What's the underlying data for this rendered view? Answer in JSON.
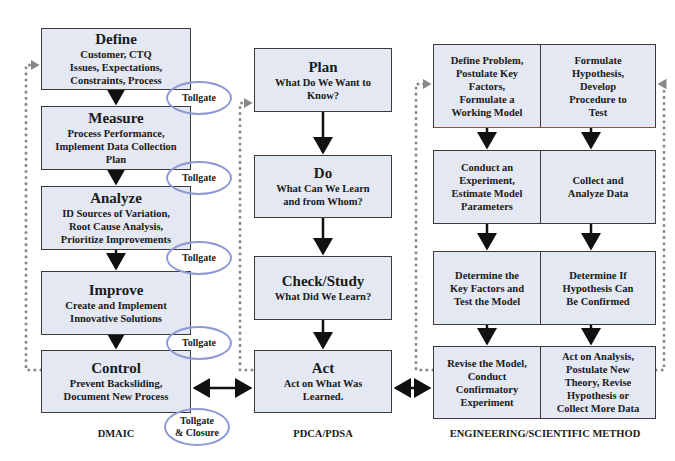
{
  "dmaic": {
    "caption": "DMAIC",
    "steps": [
      {
        "title": "Define",
        "lines": [
          "Customer, CTQ",
          "Issues, Expectations,",
          "Constraints, Process"
        ]
      },
      {
        "title": "Measure",
        "lines": [
          "Process Performance,",
          "Implement Data Collection",
          "Plan"
        ]
      },
      {
        "title": "Analyze",
        "lines": [
          "ID Sources of Variation,",
          "Root Cause Analysis,",
          "Prioritize Improvements"
        ]
      },
      {
        "title": "Improve",
        "lines": [
          "Create and Implement",
          "Innovative Solutions"
        ]
      },
      {
        "title": "Control",
        "lines": [
          "Prevent Backsliding,",
          "Document New Process"
        ]
      }
    ],
    "tollgates": [
      {
        "lines": [
          "Tollgate"
        ]
      },
      {
        "lines": [
          "Tollgate"
        ]
      },
      {
        "lines": [
          "Tollgate"
        ]
      },
      {
        "lines": [
          "Tollgate"
        ]
      },
      {
        "lines": [
          "Tollgate",
          "& Closure"
        ]
      }
    ]
  },
  "pdca": {
    "caption": "PDCA/PDSA",
    "steps": [
      {
        "title": "Plan",
        "lines": [
          "What Do We Want to",
          "Know?"
        ]
      },
      {
        "title": "Do",
        "lines": [
          "What Can We Learn",
          "and from Whom?"
        ]
      },
      {
        "title": "Check/Study",
        "lines": [
          "What Did We Learn?"
        ]
      },
      {
        "title": "Act",
        "lines": [
          "Act on What Was",
          "Learned."
        ]
      }
    ]
  },
  "engineering": {
    "caption": "ENGINEERING/SCIENTIFIC METHOD",
    "rows": [
      {
        "left": [
          "Define Problem,",
          "Postulate Key",
          "Factors,",
          "Formulate a",
          "Working Model"
        ],
        "right": [
          "Formulate",
          "Hypothesis,",
          "Develop",
          "Procedure to",
          "Test"
        ]
      },
      {
        "left": [
          "Conduct an",
          "Experiment,",
          "Estimate Model",
          "Parameters"
        ],
        "right": [
          "Collect and",
          "Analyze Data"
        ]
      },
      {
        "left": [
          "Determine the",
          "Key Factors and",
          "Test the Model"
        ],
        "right": [
          "Determine If",
          "Hypothesis Can",
          "Be Confirmed"
        ]
      },
      {
        "left": [
          "Revise the Model,",
          "Conduct",
          "Confirmatory",
          "Experiment"
        ],
        "right": [
          "Act on Analysis,",
          "Postulate New",
          "Theory, Revise",
          "Hypothesis or",
          "Collect More Data"
        ]
      }
    ]
  },
  "colors": {
    "box_fill": "#e3e8f3",
    "box_border": "#3a3a3a",
    "tollgate_ring": "#8e9ad6",
    "loop_dots": "#8a8a8a",
    "eng_first_row_underline": "#c0392b"
  }
}
